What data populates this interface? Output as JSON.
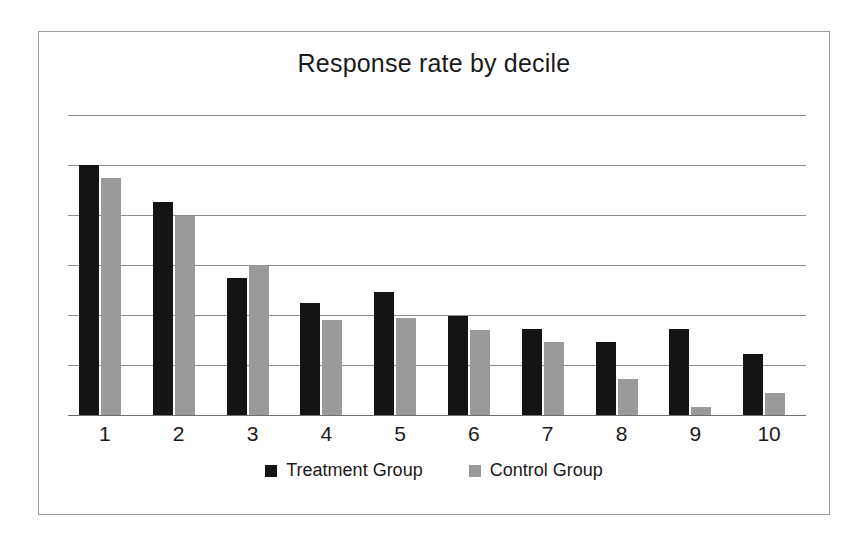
{
  "chart_data": {
    "type": "bar",
    "title": "Response rate by decile",
    "xlabel": "",
    "ylabel": "",
    "categories": [
      "1",
      "2",
      "3",
      "4",
      "5",
      "6",
      "7",
      "8",
      "9",
      "10"
    ],
    "series": [
      {
        "name": "Treatment Group",
        "color": "#141414",
        "values": [
          5.0,
          4.26,
          2.74,
          2.24,
          2.46,
          1.98,
          1.72,
          1.46,
          1.72,
          1.22
        ]
      },
      {
        "name": "Control Group",
        "color": "#9a9a9a",
        "values": [
          4.74,
          3.98,
          3.0,
          1.9,
          1.94,
          1.7,
          1.46,
          0.72,
          0.16,
          0.44
        ]
      }
    ],
    "ylim": [
      0,
      6
    ],
    "ytick_values": [
      0,
      1,
      2,
      3,
      4,
      5,
      6
    ],
    "ytick_labels": [
      "",
      "",
      "",
      "",
      "",
      "",
      ""
    ],
    "grid": true,
    "grid_color": "#8c8c8c",
    "legend_position": "bottom",
    "legend": [
      "Treatment Group",
      "Control Group"
    ],
    "frame_border_color": "#9d9d9d",
    "background": "#ffffff"
  },
  "legend_items": [
    {
      "label": "Treatment Group",
      "swatch": "treatment"
    },
    {
      "label": "Control Group",
      "swatch": "control"
    }
  ]
}
